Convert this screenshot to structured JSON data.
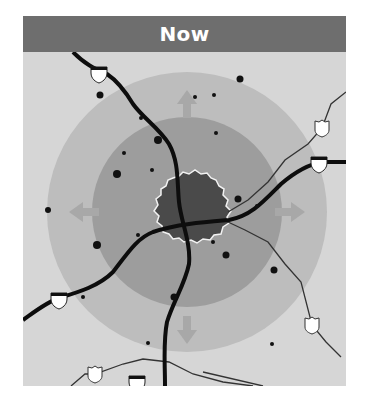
{
  "header": {
    "title": "Now"
  },
  "colors": {
    "header_bg": "#6e6e6e",
    "header_text": "#ffffff",
    "background": "#d6d6d6",
    "outer_ring": "#bdbdbd",
    "inner_ring": "#9d9d9d",
    "city_core": "#4a4a4a",
    "city_outline": "#f2f2f2",
    "arrow": "#a8a8a8",
    "highway": "#0d0d0d",
    "road": "#333333",
    "shield_fill": "#ffffff",
    "dot": "#111111"
  },
  "map": {
    "center": [
      164,
      160
    ],
    "outer_ring_radius": 140,
    "inner_ring_radius": 95,
    "growth_arrows": [
      "up",
      "down",
      "left",
      "right"
    ],
    "settlements": [
      {
        "x": 77,
        "y": 43,
        "r": 3.5
      },
      {
        "x": 172,
        "y": 45,
        "r": 2
      },
      {
        "x": 217,
        "y": 27,
        "r": 3.5
      },
      {
        "x": 101,
        "y": 101,
        "r": 2
      },
      {
        "x": 135,
        "y": 88,
        "r": 4
      },
      {
        "x": 118,
        "y": 66,
        "r": 2
      },
      {
        "x": 191,
        "y": 43,
        "r": 2
      },
      {
        "x": 193,
        "y": 81,
        "r": 2
      },
      {
        "x": 94,
        "y": 122,
        "r": 4
      },
      {
        "x": 25,
        "y": 158,
        "r": 3
      },
      {
        "x": 129,
        "y": 118,
        "r": 2
      },
      {
        "x": 215,
        "y": 147,
        "r": 3.5
      },
      {
        "x": 234,
        "y": 154,
        "r": 2
      },
      {
        "x": 74,
        "y": 193,
        "r": 4
      },
      {
        "x": 115,
        "y": 183,
        "r": 2
      },
      {
        "x": 190,
        "y": 190,
        "r": 2
      },
      {
        "x": 203,
        "y": 203,
        "r": 3.5
      },
      {
        "x": 60,
        "y": 245,
        "r": 2
      },
      {
        "x": 151,
        "y": 245,
        "r": 3.5
      },
      {
        "x": 251,
        "y": 218,
        "r": 3.5
      },
      {
        "x": 249,
        "y": 292,
        "r": 2
      },
      {
        "x": 125,
        "y": 291,
        "r": 2
      }
    ],
    "interstate_shields": [
      {
        "x": 76,
        "y": 20
      },
      {
        "x": 296,
        "y": 110
      },
      {
        "x": 36,
        "y": 246
      },
      {
        "x": 114,
        "y": 336
      }
    ],
    "us_route_shields": [
      {
        "x": 299,
        "y": 76
      },
      {
        "x": 72,
        "y": 322
      },
      {
        "x": 289,
        "y": 273
      }
    ]
  }
}
